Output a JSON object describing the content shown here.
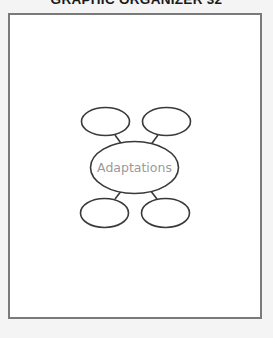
{
  "header": {
    "title": "GRAPHIC ORGANIZER 32"
  },
  "organizer": {
    "center": {
      "label": "Adaptations"
    },
    "branches": [
      {
        "position": "top-left",
        "label": ""
      },
      {
        "position": "top-right",
        "label": ""
      },
      {
        "position": "bottom-left",
        "label": ""
      },
      {
        "position": "bottom-right",
        "label": ""
      }
    ]
  },
  "colors": {
    "stroke": "#3a3a3a",
    "center_text": "#9a9a9a",
    "frame_border": "#7a7a7a"
  }
}
